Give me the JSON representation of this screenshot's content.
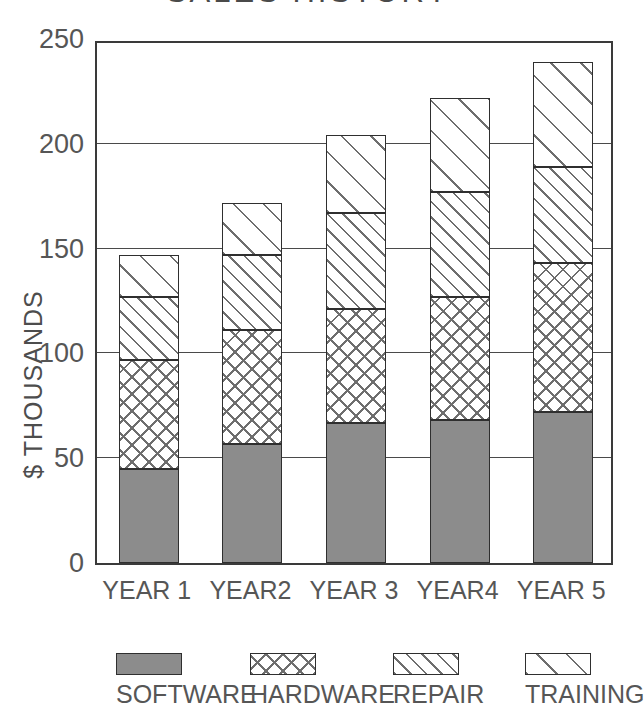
{
  "chart_data": {
    "type": "bar",
    "subtype": "stacked-column",
    "title": "SALES HISTORY",
    "xlabel": "",
    "ylabel": "$ THOUSANDS",
    "ylim": [
      0,
      250
    ],
    "yticks": [
      0,
      50,
      100,
      150,
      200,
      250
    ],
    "ytick_labels": [
      "0",
      "50",
      "100",
      "150",
      "200",
      "250"
    ],
    "grid": true,
    "grid_axis": "y",
    "legend_position": "bottom",
    "categories": [
      "YEAR 1",
      "YEAR2",
      "YEAR 3",
      "YEAR4",
      "YEAR 5"
    ],
    "series": [
      {
        "name": "SOFTWARE",
        "pattern": "solid-gray",
        "color": "#8c8c8c",
        "values": [
          45,
          57,
          67,
          68,
          72
        ]
      },
      {
        "name": "HARDWARE",
        "pattern": "crosshatch",
        "color": "#ffffff",
        "values": [
          52,
          54,
          54,
          59,
          71
        ]
      },
      {
        "name": "REPAIR",
        "pattern": "diagonal-dense",
        "color": "#ffffff",
        "values": [
          30,
          36,
          46,
          50,
          46
        ]
      },
      {
        "name": "TRAINING",
        "pattern": "diagonal-sparse",
        "color": "#ffffff",
        "values": [
          20,
          25,
          37,
          45,
          50
        ]
      }
    ],
    "totals": [
      147,
      172,
      204,
      222,
      239
    ]
  },
  "legend": {
    "items": [
      {
        "label": "SOFTWARE",
        "pattern": "solid-gray"
      },
      {
        "label": "HARDWARE",
        "pattern": "crosshatch"
      },
      {
        "label": "REPAIR",
        "pattern": "diagonal-dense"
      },
      {
        "label": "TRAINING",
        "pattern": "diagonal-sparse"
      }
    ]
  },
  "colors": {
    "bar_gray": "#8c8c8c",
    "outline": "#2f2f2f",
    "hatch": "#6e6e6e",
    "text": "#565656",
    "background": "#ffffff"
  }
}
